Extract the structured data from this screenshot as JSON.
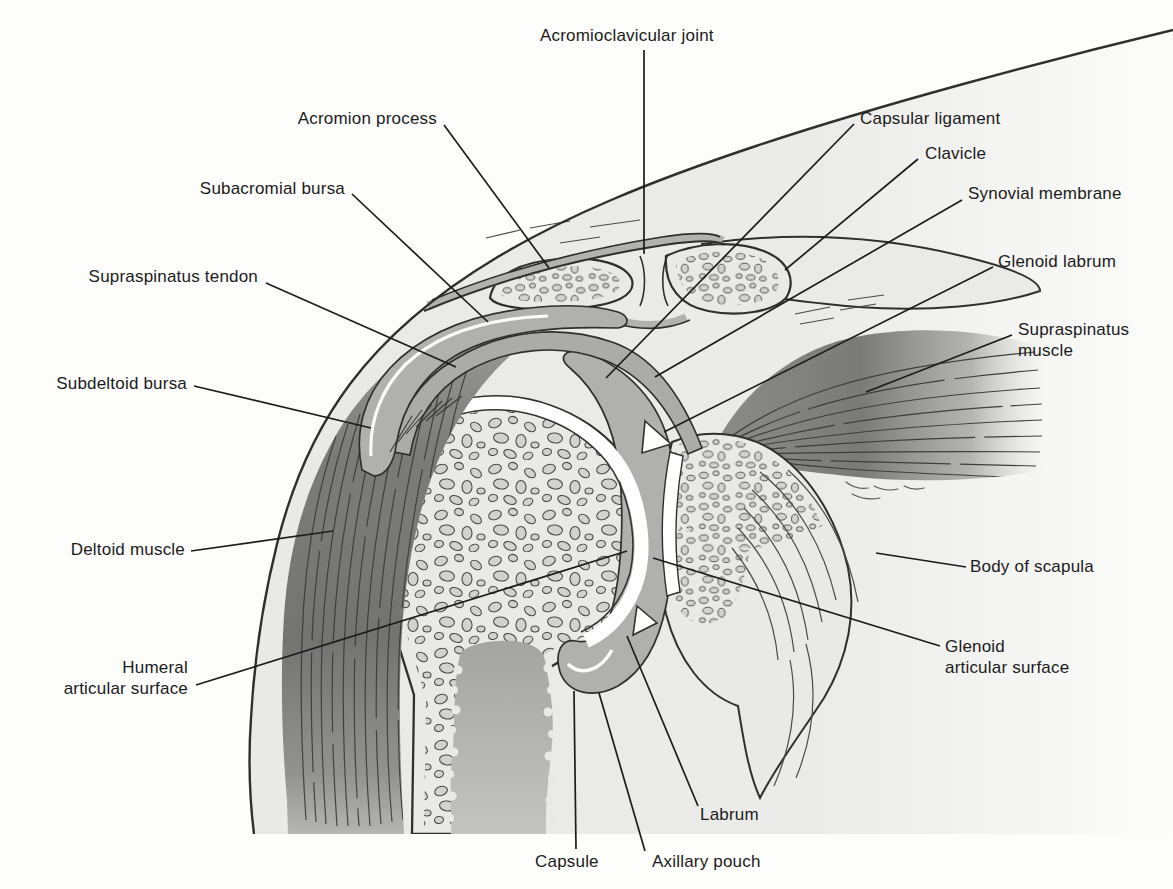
{
  "figure": {
    "kind": "anatomical-diagram",
    "labels": [
      {
        "id": "acromioclavicular-joint",
        "text": "Acromioclavicular joint"
      },
      {
        "id": "acromion-process",
        "text": "Acromion process"
      },
      {
        "id": "subacromial-bursa",
        "text": "Subacromial bursa"
      },
      {
        "id": "supraspinatus-tendon",
        "text": "Supraspinatus tendon"
      },
      {
        "id": "subdeltoid-bursa",
        "text": "Subdeltoid bursa"
      },
      {
        "id": "deltoid-muscle",
        "text": "Deltoid muscle"
      },
      {
        "id": "humeral-articular-surface",
        "text": "Humeral\narticular surface"
      },
      {
        "id": "capsular-ligament",
        "text": "Capsular ligament"
      },
      {
        "id": "clavicle",
        "text": "Clavicle"
      },
      {
        "id": "synovial-membrane",
        "text": "Synovial membrane"
      },
      {
        "id": "glenoid-labrum",
        "text": "Glenoid labrum"
      },
      {
        "id": "supraspinatus-muscle",
        "text": "Supraspinatus\nmuscle"
      },
      {
        "id": "body-of-scapula",
        "text": "Body of scapula"
      },
      {
        "id": "glenoid-articular-surface",
        "text": "Glenoid\narticular surface"
      },
      {
        "id": "labrum",
        "text": "Labrum"
      },
      {
        "id": "capsule",
        "text": "Capsule"
      },
      {
        "id": "axillary-pouch",
        "text": "Axillary pouch"
      }
    ],
    "palette": {
      "page": "#fdfdfc",
      "body_wash": "#e9e9e7",
      "bone_fill": "#e9e9e7",
      "trabecula": "#d2d2d0",
      "bursa_capsule_gray": "#b0b0ae",
      "muscle_dark": "#747472",
      "outline_ink": "#2f2f2d",
      "label_ink": "#1b1b1b",
      "cartilage": "#ffffff"
    }
  }
}
